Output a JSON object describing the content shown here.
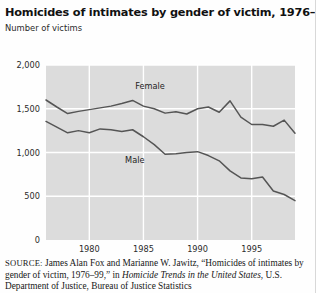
{
  "figure": {
    "title": "Homicides of intimates by gender of victim, 1976–99",
    "subtitle": "Number of victims"
  },
  "source": {
    "label": "SOURCE:",
    "line1_plain": " James Alan Fox and Marianne W. Jawitz, “Homicides of",
    "line2_plain": "intimates by gender of victim, 1976–99,” in ",
    "line2_italic": "Homicide Trends in the",
    "line3_italic": "United States",
    "line3_plain": ", U.S. Department of Justice, Bureau of Justice Statistics"
  },
  "chart_data": {
    "type": "line",
    "title": "Homicides of intimates by gender of victim, 1976–99",
    "subtitle": "Number of victims",
    "xlabel": "",
    "ylabel": "Number of victims",
    "xlim": [
      1976,
      1999
    ],
    "ylim": [
      0,
      2000
    ],
    "yticks": [
      0,
      500,
      1000,
      1500,
      2000
    ],
    "ytick_labels": [
      "0",
      "500",
      "1,000",
      "1,500",
      "2,000"
    ],
    "xticks": [
      1980,
      1985,
      1990,
      1995
    ],
    "xtick_labels": [
      "1980",
      "1985",
      "1990",
      "1995"
    ],
    "grid": true,
    "grid_color": "#ffffff",
    "plot_bg": "#dcdcdc",
    "line_color": "#555555",
    "legend_position": "inline-labels",
    "x": [
      1976,
      1977,
      1978,
      1979,
      1980,
      1981,
      1982,
      1983,
      1984,
      1985,
      1986,
      1987,
      1988,
      1989,
      1990,
      1991,
      1992,
      1993,
      1994,
      1995,
      1996,
      1997,
      1998,
      1999
    ],
    "series": [
      {
        "name": "Female",
        "label": "Female",
        "values": [
          1600,
          1520,
          1445,
          1470,
          1490,
          1510,
          1530,
          1560,
          1595,
          1530,
          1500,
          1450,
          1465,
          1440,
          1500,
          1520,
          1460,
          1590,
          1405,
          1320,
          1320,
          1300,
          1370,
          1220
        ]
      },
      {
        "name": "Male",
        "label": "Male",
        "values": [
          1355,
          1290,
          1225,
          1250,
          1225,
          1270,
          1260,
          1240,
          1260,
          1180,
          1090,
          980,
          985,
          1000,
          1010,
          965,
          905,
          790,
          710,
          700,
          720,
          560,
          520,
          450
        ]
      }
    ]
  }
}
